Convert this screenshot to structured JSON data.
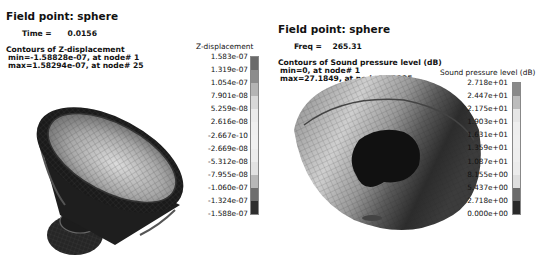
{
  "left_panel": {
    "title": "Field point: sphere",
    "time_label": "Time =",
    "time_value": "0.0156",
    "contour_label": "Contours of Z-displacement",
    "min_line": "min=-1.58828e-07, at node# 1",
    "max_line": "max=1.58294e-07, at node# 25",
    "model": "loudspeaker-cone",
    "legend": {
      "title": "Z-displacement",
      "labels": [
        "1.583e-07",
        "1.319e-07",
        "1.054e-07",
        "7.901e-08",
        "5.259e-08",
        "2.616e-08",
        "-2.667e-10",
        "-2.669e-08",
        "-5.312e-08",
        "-7.955e-08",
        "-1.060e-07",
        "-1.324e-07",
        "-1.588e-07"
      ],
      "colors": [
        "#6a6a6a",
        "#8c8c8c",
        "#b4b4b4",
        "#d8d8d8",
        "#ebebeb",
        "#efefef",
        "#f0f0f0",
        "#ececec",
        "#e2e2e2",
        "#b8b8b8",
        "#6e6e6e",
        "#2e2e2e"
      ]
    }
  },
  "right_panel": {
    "title": "Field point: sphere",
    "freq_label": "Freq =",
    "freq_value": "265.31",
    "contour_label": "Contours of Sound pressure level (dB)",
    "min_line": "min=0, at node# 1",
    "max_line": "max=27.1849, at node# 50025",
    "model": "hemisphere-field-points",
    "legend": {
      "title": "Sound pressure level (dB)",
      "labels": [
        "2.718e+01",
        "2.447e+01",
        "2.175e+01",
        "1.903e+01",
        "1.631e+01",
        "1.359e+01",
        "1.087e+01",
        "8.155e+00",
        "5.437e+00",
        "2.718e+00",
        "0.000e+00"
      ],
      "colors": [
        "#8a8a8a",
        "#bcbcbc",
        "#e6e6e6",
        "#eeeeee",
        "#efefef",
        "#eeeeee",
        "#ebebeb",
        "#dedede",
        "#6a6a6a",
        "#2a2a2a"
      ]
    }
  }
}
